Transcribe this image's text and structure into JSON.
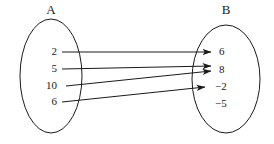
{
  "diagram": {
    "type": "set-mapping-diagram",
    "background_color": "#ffffff",
    "stroke_color": "#1a1a1a",
    "sets": {
      "left": {
        "label": "A",
        "label_x": 51,
        "label_y": 11,
        "ellipse": {
          "cx": 51,
          "cy": 76,
          "rx": 31,
          "ry": 57
        },
        "elements": [
          {
            "text": "2",
            "x": 57,
            "y": 52
          },
          {
            "text": "5",
            "x": 57,
            "y": 69
          },
          {
            "text": "10",
            "x": 57,
            "y": 86
          },
          {
            "text": "6",
            "x": 57,
            "y": 102
          }
        ]
      },
      "right": {
        "label": "B",
        "label_x": 226,
        "label_y": 11,
        "ellipse": {
          "cx": 226,
          "cy": 79,
          "rx": 34,
          "ry": 54
        },
        "elements": [
          {
            "text": "6",
            "x": 219,
            "y": 52
          },
          {
            "text": "8",
            "x": 219,
            "y": 70
          },
          {
            "text": "−2",
            "x": 215,
            "y": 87
          },
          {
            "text": "−5",
            "x": 215,
            "y": 104
          }
        ]
      }
    },
    "arrows": [
      {
        "from": "2",
        "to": "6",
        "x1": 62,
        "y1": 52,
        "x2": 211,
        "y2": 52
      },
      {
        "from": "5",
        "to": "8",
        "x1": 62,
        "y1": 69,
        "x2": 211,
        "y2": 66
      },
      {
        "from": "10",
        "to": "8",
        "x1": 66,
        "y1": 86,
        "x2": 211,
        "y2": 71
      },
      {
        "from": "6",
        "to": "−2",
        "x1": 62,
        "y1": 102,
        "x2": 205,
        "y2": 87
      }
    ],
    "unmapped_elements": [
      "−5"
    ]
  }
}
